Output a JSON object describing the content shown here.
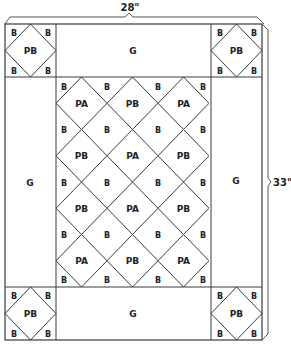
{
  "diagram": {
    "type": "quilt-layout",
    "colors": {
      "line": "#3a3a3a",
      "text": "#222222",
      "background": "#ffffff"
    },
    "dimensions": {
      "width_label": "28\"",
      "height_label": "33\""
    },
    "corner_blocks": {
      "top_left": {
        "center": "PB",
        "corners": [
          "B",
          "B",
          "B",
          "B"
        ]
      },
      "top_right": {
        "center": "PB",
        "corners": [
          "B",
          "B",
          "B",
          "B"
        ]
      },
      "bottom_left": {
        "center": "PB",
        "corners": [
          "B",
          "B",
          "B",
          "B"
        ]
      },
      "bottom_right": {
        "center": "PB",
        "corners": [
          "B",
          "B",
          "B",
          "B"
        ]
      }
    },
    "borders": {
      "top": "G",
      "bottom": "G",
      "left": "G",
      "right": "G"
    },
    "center_panel": {
      "diamond_rows": [
        [
          "PA",
          "PB",
          "PA"
        ],
        [
          "PB",
          "PA",
          "PB"
        ],
        [
          "PB",
          "PA",
          "PB"
        ],
        [
          "PA",
          "PB",
          "PA"
        ]
      ],
      "setting_triangle_label": "B"
    }
  }
}
